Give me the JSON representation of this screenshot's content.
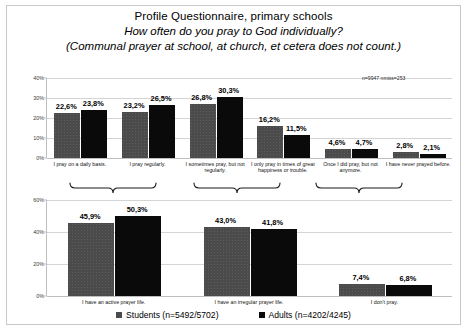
{
  "title": {
    "line1": "Profile Questionnaire, primary schools",
    "line2": "How often do you pray to God individually?",
    "line3": "(Communal prayer at school, at church, et cetera does not count.)"
  },
  "legend": {
    "students_label": "Students (n=5492/5702)",
    "adults_label": "Adults (n=4202/4245)",
    "students_color": "#4b4b4b",
    "adults_color": "#0a0a0a"
  },
  "annotations": {
    "nmiss_top": "n=9947 nmiss=253"
  },
  "chart_data": [
    {
      "id": "detailed-frequency",
      "type": "bar",
      "title": "",
      "xlabel": "",
      "ylabel": "",
      "ylim": [
        0,
        40
      ],
      "ytick_labels": [
        "0%",
        "10%",
        "20%",
        "30%",
        "40%"
      ],
      "ytick_values": [
        0,
        10,
        20,
        30,
        40
      ],
      "grid": true,
      "legend_position": "bottom",
      "categories": [
        "I pray on a daily basis.",
        "I pray regularly.",
        "I sometimes pray, but not regularly.",
        "I only pray in times of great happiness or trouble.",
        "Once I did pray, but not anymore.",
        "I have never prayed before."
      ],
      "series": [
        {
          "name": "Students (n=5492/5702)",
          "values": [
            22.6,
            23.2,
            26.8,
            16.2,
            4.6,
            2.8
          ],
          "labels": [
            "22,6%",
            "23,2%",
            "26,8%",
            "16,2%",
            "4,6%",
            "2,8%"
          ]
        },
        {
          "name": "Adults (n=4202/4245)",
          "values": [
            23.8,
            26.5,
            30.3,
            11.5,
            4.7,
            2.1
          ],
          "labels": [
            "23,8%",
            "26,5%",
            "30,3%",
            "11,5%",
            "4,7%",
            "2,1%"
          ]
        }
      ]
    },
    {
      "id": "summary-prayer-life",
      "type": "bar",
      "title": "",
      "xlabel": "",
      "ylabel": "",
      "ylim": [
        0,
        60
      ],
      "ytick_labels": [
        "0%",
        "20%",
        "40%",
        "60%"
      ],
      "ytick_values": [
        0,
        20,
        40,
        60
      ],
      "grid": true,
      "legend_position": "bottom",
      "categories": [
        "I have an active prayer life.",
        "I have an irregular prayer life.",
        "I don't pray."
      ],
      "series": [
        {
          "name": "Students (n=5492/5702)",
          "values": [
            45.9,
            43.0,
            7.4
          ],
          "labels": [
            "45,9%",
            "43,0%",
            "7,4%"
          ]
        },
        {
          "name": "Adults (n=4202/4245)",
          "values": [
            50.3,
            41.8,
            6.8
          ],
          "labels": [
            "50,3%",
            "41,8%",
            "6,8%"
          ]
        }
      ]
    }
  ]
}
